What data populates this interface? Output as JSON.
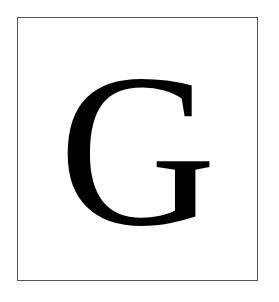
{
  "card": {
    "letter": "G",
    "text_color": "#000000",
    "border_color": "#555555",
    "background": "#ffffff"
  }
}
